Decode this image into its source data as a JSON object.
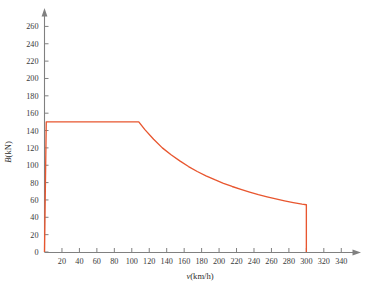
{
  "figure": {
    "background_color": "#ffffff",
    "axis_color": "#808080",
    "text_color": "#3a3a3a"
  },
  "chart_data": {
    "type": "line",
    "title": "",
    "subtitle": "",
    "xlabel": "v(km/h)",
    "ylabel": "B(kN)",
    "xlabel_symbol": "v",
    "xlabel_unit": "(km/h)",
    "ylabel_symbol": "B",
    "ylabel_unit": "(kN)",
    "line_color": "#E8562F",
    "grid": false,
    "legend": null,
    "legend_position": "none",
    "xlim": [
      0,
      350
    ],
    "ylim": [
      0,
      272
    ],
    "xticks": [
      0,
      20,
      40,
      60,
      80,
      100,
      120,
      140,
      160,
      180,
      200,
      220,
      240,
      260,
      280,
      300,
      320,
      340
    ],
    "xtick_labels": [
      "",
      "20",
      "40",
      "60",
      "80",
      "100",
      "120",
      "140",
      "160",
      "180",
      "200",
      "220",
      "240",
      "260",
      "280",
      "300",
      "320",
      "340"
    ],
    "yticks": [
      0,
      20,
      40,
      60,
      80,
      100,
      120,
      140,
      160,
      180,
      200,
      220,
      240,
      260
    ],
    "ytick_labels": [
      "0",
      "20",
      "40",
      "60",
      "80",
      "100",
      "120",
      "140",
      "160",
      "180",
      "200",
      "220",
      "240",
      "260"
    ],
    "series": [
      {
        "name": "braking-force-curve",
        "color": "#E8562F",
        "description": "Constant braking force up to 108 km/h, then constant-power hyperbolic decay to 300 km/h, then vertical drop to zero",
        "x": [
          0,
          2,
          108,
          115,
          125,
          135,
          145,
          155,
          165,
          175,
          185,
          195,
          205,
          215,
          225,
          235,
          245,
          255,
          265,
          275,
          285,
          295,
          300,
          300
        ],
        "y": [
          0,
          150,
          150,
          141,
          130,
          120,
          112,
          105,
          98.5,
          92.8,
          87.8,
          83.3,
          79.2,
          75.5,
          72.2,
          69.1,
          66.2,
          63.6,
          61.2,
          59.0,
          57.0,
          55.2,
          54.5,
          0
        ]
      }
    ],
    "annotations": [
      {
        "name": "plateau-value",
        "value": 150,
        "unit": "kN",
        "from_x": 2,
        "to_x": 108
      },
      {
        "name": "knee-speed",
        "value": 108,
        "unit": "km/h"
      },
      {
        "name": "cutoff-speed",
        "value": 300,
        "unit": "km/h"
      },
      {
        "name": "cutoff-force",
        "value": 54.5,
        "unit": "kN"
      }
    ]
  }
}
